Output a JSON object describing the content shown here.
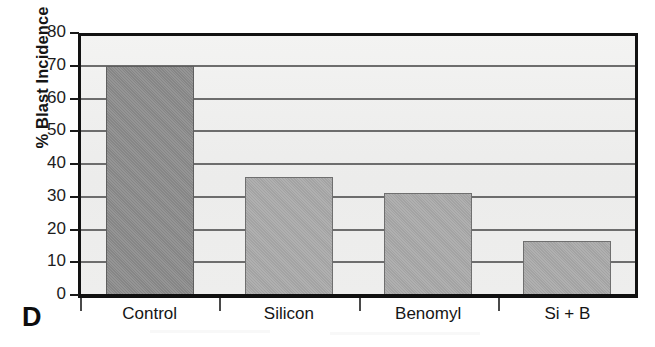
{
  "panel": {
    "letter": "D"
  },
  "chart_data": {
    "type": "bar",
    "title": "",
    "subtitle": "",
    "xlabel": "",
    "ylabel": "% Blast Incidence",
    "categories": [
      "Control",
      "Silicon",
      "Benomyl",
      "Si + B"
    ],
    "values": [
      70,
      36,
      31,
      16.5
    ],
    "series": [
      {
        "name": "% Blast Incidence",
        "values": [
          70,
          36,
          31,
          16.5
        ]
      }
    ],
    "ylim": [
      0,
      80
    ],
    "ytick_labels": [
      "0",
      "10",
      "20",
      "30",
      "40",
      "50",
      "60",
      "70",
      "80"
    ],
    "ytick_values": [
      0,
      10,
      20,
      30,
      40,
      50,
      60,
      70,
      80
    ],
    "grid": true,
    "grid_axis": "y",
    "legend": false,
    "legend_position": "none",
    "bar_colors": [
      "#8b8b8b",
      "#a9a9a9",
      "#a9a9a9",
      "#a9a9a9"
    ],
    "plot_background": "#efefee",
    "axis_color": "#121212",
    "grid_color": "#6d6d6d"
  }
}
